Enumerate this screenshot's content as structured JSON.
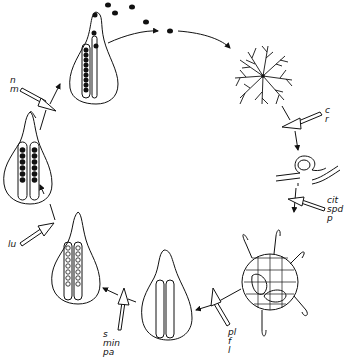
{
  "diagram": {
    "type": "life-cycle",
    "colors": {
      "line": "#111111",
      "background": "#ffffff"
    },
    "stages": [
      {
        "id": "mature-pycnidium-spore-release",
        "position": "top-center"
      },
      {
        "id": "mycelium",
        "position": "upper-right"
      },
      {
        "id": "hyphal-coil",
        "position": "right"
      },
      {
        "id": "sclerotium-like-body",
        "position": "lower-right"
      },
      {
        "id": "empty-fruiting-body",
        "position": "bottom-center"
      },
      {
        "id": "developing-asci",
        "position": "lower-left"
      },
      {
        "id": "mature-asci",
        "position": "upper-left"
      }
    ],
    "factor_labels": [
      {
        "id": "factors-nm",
        "lines": [
          "n",
          "m"
        ]
      },
      {
        "id": "factors-cr",
        "lines": [
          "c",
          "r"
        ]
      },
      {
        "id": "factors-cit-spd-p",
        "lines": [
          "cit",
          "spd",
          "p"
        ]
      },
      {
        "id": "factors-pl-f-l",
        "lines": [
          "pl",
          "f",
          "l"
        ]
      },
      {
        "id": "factors-s-min-pa",
        "lines": [
          "s",
          "min",
          "pa"
        ]
      },
      {
        "id": "factors-lu",
        "lines": [
          "lu"
        ]
      }
    ]
  }
}
